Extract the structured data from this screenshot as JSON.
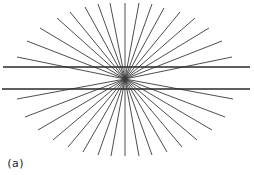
{
  "figure": {
    "label": "(a)",
    "center": [
      125,
      79
    ],
    "rays": [
      [
        17,
        57
      ],
      [
        27,
        41
      ],
      [
        40,
        28
      ],
      [
        57,
        18
      ],
      [
        70,
        12
      ],
      [
        85,
        7
      ],
      [
        98,
        4
      ],
      [
        110,
        3
      ],
      [
        125,
        3
      ],
      [
        139,
        3
      ],
      [
        152,
        4
      ],
      [
        164,
        8
      ],
      [
        180,
        12
      ],
      [
        195,
        18
      ],
      [
        209,
        28
      ],
      [
        222,
        41
      ],
      [
        232,
        57
      ],
      [
        17,
        99
      ],
      [
        25,
        117
      ],
      [
        38,
        130
      ],
      [
        53,
        140
      ],
      [
        68,
        147
      ],
      [
        83,
        152
      ],
      [
        98,
        155
      ],
      [
        111,
        156
      ],
      [
        125,
        156
      ],
      [
        139,
        156
      ],
      [
        152,
        155
      ],
      [
        167,
        152
      ],
      [
        182,
        147
      ],
      [
        197,
        140
      ],
      [
        212,
        130
      ],
      [
        225,
        117
      ],
      [
        233,
        99
      ]
    ],
    "parallel_lines": [
      {
        "x1": 3,
        "y1": 67,
        "x2": 250,
        "y2": 67
      },
      {
        "x1": 2,
        "y1": 89,
        "x2": 250,
        "y2": 89
      }
    ],
    "colors": {
      "background": "#ffffff",
      "ray": "#3a3a3a",
      "line": "#2a2a2a"
    }
  }
}
